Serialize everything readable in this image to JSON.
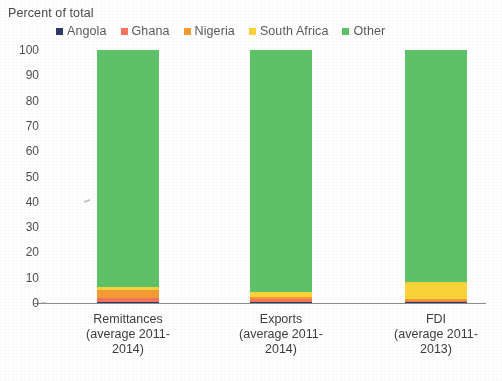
{
  "chart_data": {
    "type": "bar",
    "subtype": "stacked-100-percent",
    "title": "Percent of total",
    "xlabel": "",
    "ylabel": "",
    "ylim": [
      0,
      100
    ],
    "ytick_step": 10,
    "ytick_labels": [
      "100",
      "90",
      "80",
      "70",
      "60",
      "50",
      "40",
      "30",
      "20",
      "10",
      "0"
    ],
    "grid": false,
    "legend_position": "top",
    "categories": [
      "Remittances\n(average 2011-\n2014)",
      "Exports\n(average 2011-\n2014)",
      "FDI\n(average 2011-\n2013)"
    ],
    "category_names": [
      "Remittances",
      "Exports",
      "FDI"
    ],
    "category_periods": [
      "(average 2011-2014)",
      "(average 2011-2014)",
      "(average 2011-2013)"
    ],
    "series": [
      {
        "name": "Angola",
        "color": "#2b3a63",
        "values": [
          0.4,
          0.3,
          0.3
        ]
      },
      {
        "name": "Ghana",
        "color": "#f4755c",
        "values": [
          1.6,
          1.2,
          0.5
        ]
      },
      {
        "name": "Nigeria",
        "color": "#f59b33",
        "values": [
          3.2,
          1.0,
          0.6
        ]
      },
      {
        "name": "South Africa",
        "color": "#fbd43a",
        "values": [
          1.3,
          1.8,
          7.1
        ]
      },
      {
        "name": "Other",
        "color": "#5ec269",
        "values": [
          93.5,
          95.7,
          91.5
        ]
      }
    ]
  },
  "legend": {
    "items": [
      {
        "label": "Angola",
        "color": "#2b3a63"
      },
      {
        "label": "Ghana",
        "color": "#f4755c"
      },
      {
        "label": "Nigeria",
        "color": "#f59b33"
      },
      {
        "label": "South Africa",
        "color": "#fbd43a"
      },
      {
        "label": "Other",
        "color": "#5ec269"
      }
    ]
  }
}
